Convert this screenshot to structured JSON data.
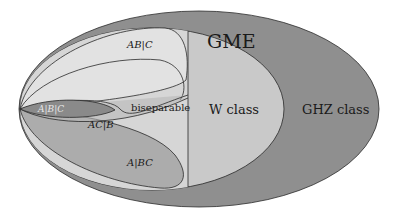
{
  "diagram": {
    "type": "nested-venn",
    "title": "",
    "labels": {
      "gme": "GME",
      "ghz_class": "GHZ class",
      "w_class": "W class",
      "biseparable": "biseparable",
      "ab_c": "AB|C",
      "ac_b": "AC|B",
      "a_bc": "A|BC",
      "a_b_c": "A|B|C"
    },
    "colors": {
      "ghz_fill": "#8f8f8f",
      "w_fill": "#c9c9c9",
      "bisep_fill": "#d6d6d6",
      "ab_c_fill": "#e4e4e4",
      "ac_b_fill": "#b8b8b8",
      "a_bc_fill": "#a4a4a4",
      "a_b_c_fill": "#8a8a8a",
      "stroke": "#2a2a2a",
      "fully_sep_text": "#e8e8e8"
    },
    "nesting": [
      "GHZ class ⊃ W class ⊃ biseparable ⊃ {AB|C, AC|B, A|BC} ⊃ A|B|C",
      "GME = GHZ class ∪ W class minus biseparable"
    ]
  }
}
